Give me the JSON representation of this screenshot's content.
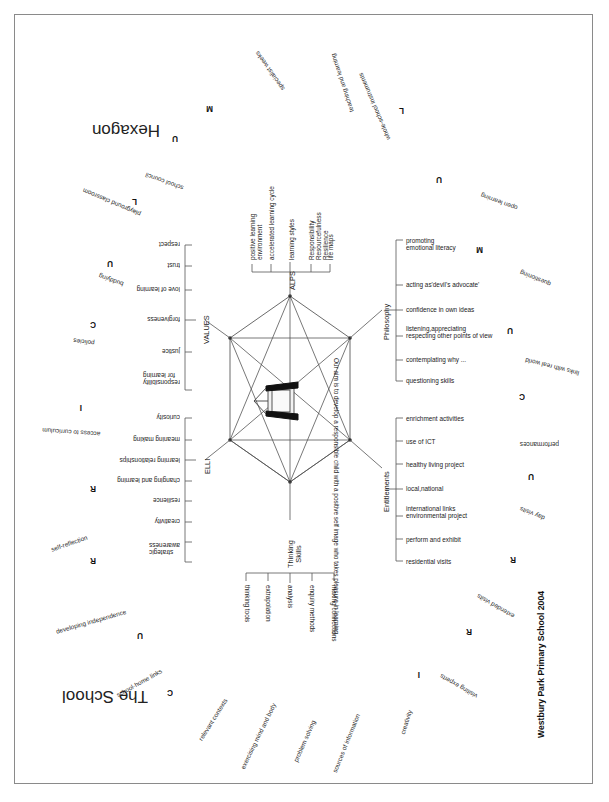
{
  "page": {
    "title": "Hexagon",
    "subtitle": "The School",
    "credit": "Westbury Park Primary School 2004"
  },
  "center": {
    "aim_text": "Our aim is to develop a responsible child with a positive self image who takes pleasure in learning",
    "easel_icon": "easel-icon"
  },
  "branches": [
    {
      "id": "values",
      "name": "VALUES",
      "items": [
        "respect",
        "trust",
        "love of learning",
        "forgiveness",
        "justice",
        "responsibility\nfor learning"
      ]
    },
    {
      "id": "alps",
      "name": "ALPS",
      "items": [
        "positive learning\nenvironment",
        "accelerated learning cycle",
        "learning styles",
        "Responsibility\nResourcefulness\nResilience",
        "life maps"
      ]
    },
    {
      "id": "philosophy",
      "name": "Philosophy",
      "items": [
        "promoting\nemotional literacy",
        "acting as'devil's advocate'",
        "confidence in own ideas",
        "listening,appreciating\nrespecting other points of view",
        "contemplating why ...",
        "questioning skills"
      ]
    },
    {
      "id": "entitlements",
      "name": "Entitlements",
      "items": [
        "enrichment activities",
        "use of ICT",
        "healthy living project",
        "local,national",
        "international links\nenvironmental project",
        "perform and exhibit",
        "residential visits"
      ]
    },
    {
      "id": "thinking-skills",
      "name": "Thinking\nSkills",
      "items": [
        "thinking tools",
        "extrapolation",
        "analysis",
        "enquiry methods",
        "making connections"
      ]
    },
    {
      "id": "elli",
      "name": "ELLI",
      "items": [
        "curiosity",
        "meaning making",
        "learning relationships",
        "changing and learning",
        "resilience",
        "creativity",
        "strategic\nawareness"
      ]
    }
  ],
  "ring_letters": [
    "M",
    "U",
    "L",
    "U",
    "C",
    "I",
    "R",
    "R",
    "U",
    "C",
    "I",
    "R",
    "R",
    "U",
    "C",
    "U",
    "M",
    "U",
    "L"
  ],
  "cloud_words": [
    "specialist weeks",
    "teaching and learning",
    "whole-school instruments",
    "school council",
    "playground classroom",
    "buddying",
    "policies",
    "access to curriculum",
    "self-reflection",
    "developing independence",
    "school-home links",
    "relevant contexts",
    "exercising mind and body",
    "problem solving",
    "sources of information",
    "creativity",
    "visiting experts",
    "extended visits",
    "day visits",
    "performances",
    "links with real world",
    "questioning",
    "open learning"
  ],
  "colors": {
    "ink": "#1a1a1a",
    "frame": "#8a8a8a",
    "line": "#555555"
  }
}
